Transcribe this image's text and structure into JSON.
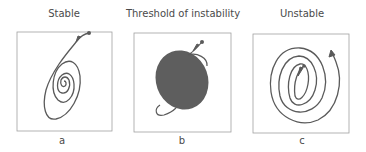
{
  "panels": [
    {
      "id": "a",
      "title": "Stable",
      "label": "a",
      "description": "trajectory spirals inward to a stable point"
    },
    {
      "id": "b",
      "title": "Threshold of instability",
      "label": "b",
      "description": "trajectory fills a closed region without diverging"
    },
    {
      "id": "c",
      "title": "Unstable",
      "label": "c",
      "description": "trajectory spirals outward away from the origin"
    }
  ],
  "colors": {
    "stroke": "#5a5a5a",
    "fill": "#5e5e5e",
    "frame": "#9a9a9a",
    "text": "#4a4a4a"
  }
}
